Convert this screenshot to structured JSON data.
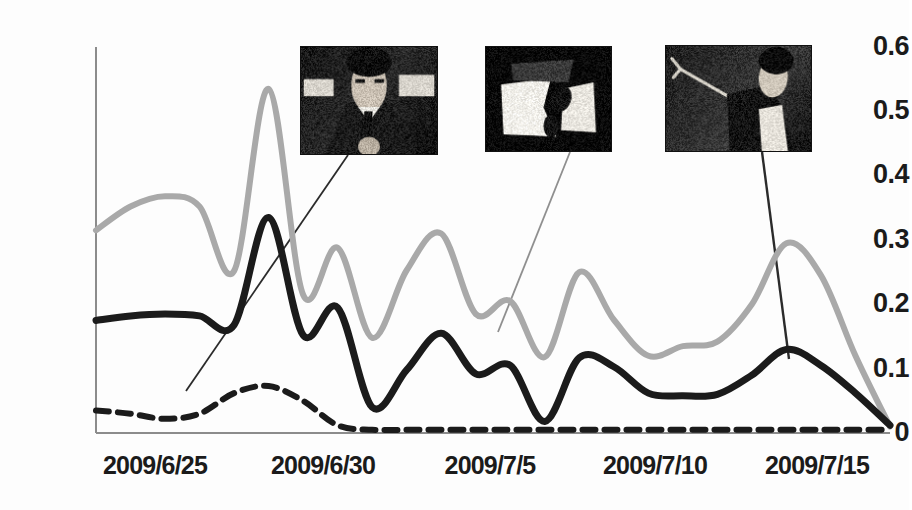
{
  "chart_data": {
    "type": "line",
    "title": "",
    "subtitle": "",
    "xlabel": "",
    "ylabel": "",
    "grid": false,
    "legend_position": "none",
    "ylim": [
      0,
      0.6
    ],
    "yticks": [
      "0",
      "0.1",
      "0.2",
      "0.3",
      "0.4",
      "0.5",
      "0.6"
    ],
    "ytick_values": [
      0,
      0.1,
      0.2,
      0.3,
      0.4,
      0.5,
      0.6
    ],
    "xticks": [
      "2009/6/25",
      "2009/6/30",
      "2009/7/5",
      "2009/7/10",
      "2009/7/15"
    ],
    "x_range": [
      "2009/6/24",
      "2009/7/17"
    ],
    "x": [
      0,
      1,
      2,
      3,
      4,
      5,
      6,
      7,
      8,
      9,
      10,
      11,
      12,
      13,
      14,
      15,
      16,
      17,
      18,
      19,
      20,
      21,
      22,
      23
    ],
    "series": [
      {
        "name": "gray-series",
        "style": "solid",
        "color": "#a9a9a9",
        "width": 6,
        "values": [
          0.315,
          0.352,
          0.368,
          0.352,
          0.252,
          0.535,
          0.215,
          0.288,
          0.148,
          0.253,
          0.31,
          0.185,
          0.205,
          0.118,
          0.25,
          0.176,
          0.12,
          0.135,
          0.142,
          0.2,
          0.295,
          0.245,
          0.12,
          0.01
        ]
      },
      {
        "name": "black-series",
        "style": "solid",
        "color": "#1b1b1b",
        "width": 7,
        "values": [
          0.175,
          0.182,
          0.185,
          0.182,
          0.168,
          0.335,
          0.152,
          0.195,
          0.04,
          0.098,
          0.155,
          0.092,
          0.105,
          0.018,
          0.117,
          0.103,
          0.062,
          0.058,
          0.06,
          0.09,
          0.13,
          0.105,
          0.062,
          0.012
        ]
      },
      {
        "name": "dashed-series",
        "style": "dashed",
        "color": "#1b1b1b",
        "width": 6,
        "values": [
          0.035,
          0.03,
          0.022,
          0.03,
          0.062,
          0.073,
          0.05,
          0.012,
          0.005,
          0.005,
          0.005,
          0.005,
          0.005,
          0.005,
          0.005,
          0.005,
          0.005,
          0.005,
          0.005,
          0.005,
          0.005,
          0.005,
          0.005,
          0.005
        ]
      }
    ],
    "annotations": [
      {
        "name": "thumbnail-portrait-suit",
        "caption": "",
        "image_kind": "dark-portrait-person-in-suit",
        "box": [
          300,
          46,
          138,
          109
        ],
        "leader_from": [
          348,
          155
        ],
        "leader_to": [
          186,
          391
        ]
      },
      {
        "name": "thumbnail-high-contrast-scene",
        "caption": "",
        "image_kind": "high-contrast-white-shapes-scene",
        "box": [
          485,
          46,
          127,
          106
        ],
        "leader_from": [
          570,
          152
        ],
        "leader_to": [
          498,
          332
        ]
      },
      {
        "name": "thumbnail-performer-arm-raised",
        "caption": "",
        "image_kind": "performer-arm-raised-stage",
        "box": [
          665,
          45,
          147,
          107
        ],
        "leader_from": [
          762,
          152
        ],
        "leader_to": [
          789,
          359
        ]
      }
    ]
  },
  "axes": {
    "y_axis_color": "#8c8c8c",
    "x_axis_color": "#8c8c8c",
    "plot_left": 96,
    "plot_right": 890,
    "plot_top": 47,
    "plot_bottom": 433
  }
}
